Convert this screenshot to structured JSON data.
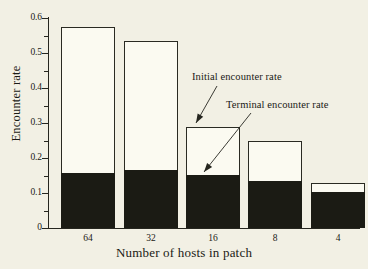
{
  "chart_data": {
    "type": "bar",
    "title": "",
    "subtitle": "",
    "xlabel": "Number of hosts in patch",
    "ylabel": "Encounter rate",
    "categories": [
      "64",
      "32",
      "16",
      "8",
      "4"
    ],
    "ylim": [
      0,
      0.6
    ],
    "xlim_note": "categorical",
    "grid": false,
    "legend_position": "inline-annotations",
    "y_major_ticks": [
      "0",
      "0.1",
      "0.2",
      "0.3",
      "0.4",
      "0.5",
      "0.6"
    ],
    "y_major_tick_values": [
      0,
      0.1,
      0.2,
      0.3,
      0.4,
      0.5,
      0.6
    ],
    "y_minor_tick_values": [
      0.05,
      0.15,
      0.25,
      0.35,
      0.45,
      0.55
    ],
    "stacked": true,
    "series": [
      {
        "name": "Initial encounter rate",
        "fill": "#fbfaf1",
        "description": "white upper segment, top of bar",
        "values": [
          0.575,
          0.535,
          0.29,
          0.25,
          0.128
        ]
      },
      {
        "name": "Terminal encounter rate",
        "fill": "#1b1b14",
        "description": "black lower segment",
        "values": [
          0.157,
          0.165,
          0.152,
          0.135,
          0.103
        ]
      }
    ],
    "annotations": [
      {
        "text": "Initial encounter rate",
        "points_to": "white upper portion of bar 16",
        "label_x": 192,
        "label_y": 71,
        "arrow_from_x": 217,
        "arrow_from_y": 86,
        "arrow_to_x": 196,
        "arrow_to_y": 123
      },
      {
        "text": "Terminal encounter rate",
        "points_to": "black lower portion of bar 16",
        "label_x": 226,
        "label_y": 99,
        "arrow_from_x": 251,
        "arrow_from_y": 113,
        "arrow_to_x": 204,
        "arrow_to_y": 172
      }
    ]
  },
  "colors": {
    "background": "#f2f0e4",
    "axis": "#26261f",
    "bar_outline": "#2a2a22",
    "bar_fill_initial": "#fbfaf1",
    "bar_fill_terminal": "#1b1b14",
    "text": "#1a1a15"
  }
}
